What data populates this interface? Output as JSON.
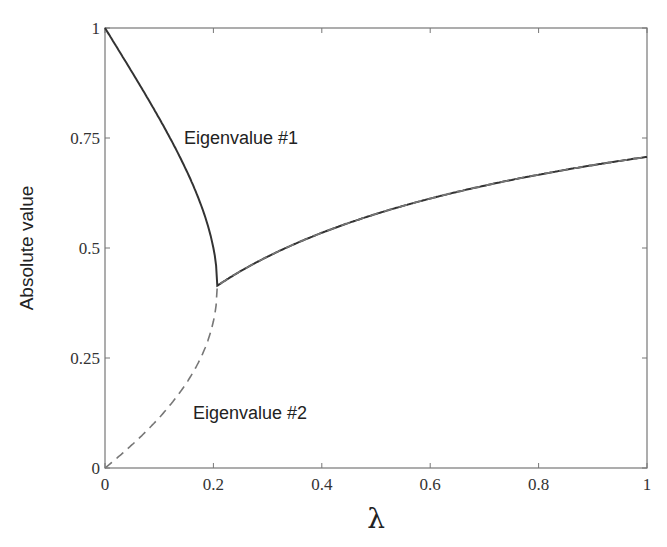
{
  "chart_data": {
    "type": "line",
    "title": "",
    "xlabel": "λ",
    "ylabel": "Absolute value",
    "xlim": [
      0,
      1
    ],
    "ylim": [
      0,
      1
    ],
    "grid": false,
    "legend": null,
    "x_ticks": [
      "0",
      "0.2",
      "0.4",
      "0.6",
      "0.8",
      "1"
    ],
    "y_ticks": [
      "0",
      "0.25",
      "0.5",
      "0.75",
      "1"
    ],
    "x": [
      0,
      0.05,
      0.1,
      0.15,
      0.2,
      0.207,
      0.3,
      0.4,
      0.5,
      0.6,
      0.7,
      0.8,
      0.9,
      1.0
    ],
    "series": [
      {
        "name": "Eigenvalue #1",
        "style": "solid",
        "values": [
          1.0,
          0.94,
          0.87,
          0.79,
          0.66,
          0.414,
          0.48,
          0.53,
          0.58,
          0.61,
          0.64,
          0.67,
          0.69,
          0.71
        ]
      },
      {
        "name": "Eigenvalue #2",
        "style": "dashed",
        "values": [
          0.0,
          0.05,
          0.12,
          0.18,
          0.31,
          0.414,
          0.48,
          0.53,
          0.58,
          0.61,
          0.64,
          0.67,
          0.69,
          0.71
        ]
      }
    ],
    "annotations": [
      {
        "text": "Eigenvalue #1",
        "x": 0.14,
        "y": 0.76
      },
      {
        "text": "Eigenvalue #2",
        "x": 0.14,
        "y": 0.16
      }
    ]
  }
}
